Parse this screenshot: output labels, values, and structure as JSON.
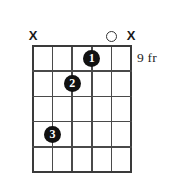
{
  "chord_diagram": {
    "instrument": "guitar",
    "string_count": 6,
    "fret_count": 5,
    "starting_fret_label": "9 fr",
    "string_markers": [
      {
        "string": 1,
        "symbol": "X",
        "meaning": "muted"
      },
      {
        "string": 2,
        "symbol": "",
        "meaning": "fretted"
      },
      {
        "string": 3,
        "symbol": "",
        "meaning": "fretted"
      },
      {
        "string": 4,
        "symbol": "",
        "meaning": "fretted"
      },
      {
        "string": 5,
        "symbol": "O",
        "meaning": "open"
      },
      {
        "string": 6,
        "symbol": "X",
        "meaning": "muted"
      }
    ],
    "finger_dots": [
      {
        "finger": "1",
        "string": 4,
        "fret": 1
      },
      {
        "finger": "2",
        "string": 3,
        "fret": 2
      },
      {
        "finger": "3",
        "string": 2,
        "fret": 4
      }
    ],
    "colors": {
      "background": "#ffffff",
      "grid_line": "#4a4a4a",
      "grid_edge": "#3a3a3a",
      "dot_fill": "#111111",
      "dot_text": "#ffffff",
      "marker_text": "#1a1a1a",
      "label_text": "#242424"
    }
  }
}
